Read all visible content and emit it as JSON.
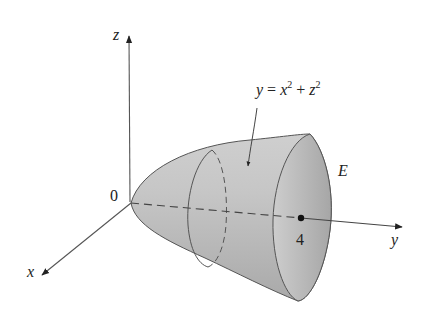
{
  "figure": {
    "axes": {
      "x": "x",
      "y": "y",
      "z": "z",
      "origin": "0"
    },
    "surface_equation": {
      "lhs": "y",
      "eq": " = ",
      "x": "x",
      "x_exp": "2",
      "plus": " + ",
      "z": "z",
      "z_exp": "2"
    },
    "region_label": "E",
    "tick_label": "4",
    "colors": {
      "surface_light": "#d8d8d8",
      "surface_dark": "#9a9a9a",
      "cap": "#bdbdbd",
      "line": "#555555"
    }
  }
}
